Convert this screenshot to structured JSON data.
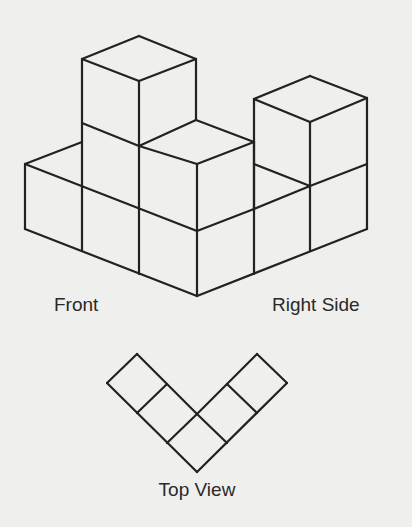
{
  "labels": {
    "front": "Front",
    "right_side": "Right Side",
    "top_view": "Top View"
  },
  "style": {
    "stroke": "#222222",
    "stroke_width": 2.2,
    "background": "#efefed"
  },
  "isometric_figure": {
    "description": "Isometric drawing of stacked unit cubes: L-shaped base layer with two 2-cube-high columns",
    "segments": [
      [
        [
          25,
          164
        ],
        [
          25,
          229
        ]
      ],
      [
        [
          25,
          229
        ],
        [
          197,
          296
        ]
      ],
      [
        [
          197,
          296
        ],
        [
          367,
          229
        ]
      ],
      [
        [
          367,
          229
        ],
        [
          367,
          98
        ]
      ],
      [
        [
          25,
          164
        ],
        [
          197,
          231
        ]
      ],
      [
        [
          197,
          231
        ],
        [
          254,
          209
        ]
      ],
      [
        [
          82,
          186
        ],
        [
          82,
          251
        ]
      ],
      [
        [
          139,
          209
        ],
        [
          139,
          274
        ]
      ],
      [
        [
          197,
          164
        ],
        [
          197,
          296
        ]
      ],
      [
        [
          254,
          142
        ],
        [
          254,
          274
        ]
      ],
      [
        [
          310,
          122
        ],
        [
          310,
          251
        ]
      ],
      [
        [
          25,
          164
        ],
        [
          82,
          142
        ]
      ],
      [
        [
          82,
          59
        ],
        [
          82,
          186
        ]
      ],
      [
        [
          82,
          59
        ],
        [
          139,
          36
        ]
      ],
      [
        [
          139,
          36
        ],
        [
          196,
          59
        ]
      ],
      [
        [
          82,
          59
        ],
        [
          139,
          81
        ]
      ],
      [
        [
          139,
          81
        ],
        [
          196,
          59
        ]
      ],
      [
        [
          139,
          81
        ],
        [
          139,
          209
        ]
      ],
      [
        [
          196,
          59
        ],
        [
          196,
          120
        ]
      ],
      [
        [
          82,
          123
        ],
        [
          139,
          146
        ]
      ],
      [
        [
          139,
          146
        ],
        [
          196,
          120
        ]
      ],
      [
        [
          139,
          146
        ],
        [
          197,
          164
        ]
      ],
      [
        [
          196,
          120
        ],
        [
          254,
          142
        ]
      ],
      [
        [
          197,
          164
        ],
        [
          254,
          142
        ]
      ],
      [
        [
          254,
          209
        ],
        [
          310,
          186
        ]
      ],
      [
        [
          310,
          186
        ],
        [
          367,
          164
        ]
      ],
      [
        [
          254,
          164
        ],
        [
          310,
          186
        ]
      ],
      [
        [
          254,
          99
        ],
        [
          254,
          209
        ]
      ],
      [
        [
          254,
          99
        ],
        [
          310,
          76
        ]
      ],
      [
        [
          310,
          76
        ],
        [
          367,
          98
        ]
      ],
      [
        [
          254,
          99
        ],
        [
          310,
          122
        ]
      ],
      [
        [
          310,
          122
        ],
        [
          367,
          98
        ]
      ]
    ]
  },
  "top_view": {
    "segments": [
      [
        [
          107,
          383
        ],
        [
          137,
          354
        ]
      ],
      [
        [
          137,
          354
        ],
        [
          197,
          414
        ]
      ],
      [
        [
          107,
          383
        ],
        [
          197,
          472
        ]
      ],
      [
        [
          137,
          413
        ],
        [
          167,
          384
        ]
      ],
      [
        [
          167,
          443
        ],
        [
          197,
          414
        ]
      ],
      [
        [
          197,
          472
        ],
        [
          287,
          383
        ]
      ],
      [
        [
          287,
          383
        ],
        [
          257,
          354
        ]
      ],
      [
        [
          257,
          354
        ],
        [
          197,
          414
        ]
      ],
      [
        [
          227,
          384
        ],
        [
          257,
          413
        ]
      ],
      [
        [
          197,
          414
        ],
        [
          227,
          443
        ]
      ]
    ]
  }
}
